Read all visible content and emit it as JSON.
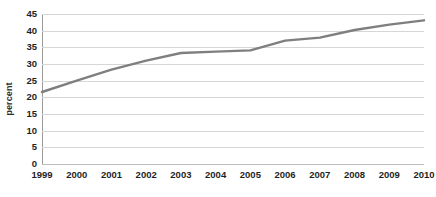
{
  "chart_data": {
    "type": "line",
    "title": "",
    "subtitle": "",
    "xlabel": "",
    "ylabel": "percent",
    "categories": [
      "1999",
      "2000",
      "2001",
      "2002",
      "2003",
      "2004",
      "2005",
      "2006",
      "2007",
      "2008",
      "2009",
      "2010"
    ],
    "values": [
      21.6,
      25.0,
      28.3,
      31.0,
      33.3,
      33.7,
      34.1,
      37.0,
      37.9,
      40.2,
      41.8,
      43.1
    ],
    "series": [
      {
        "name": "percent",
        "values": [
          21.6,
          25.0,
          28.3,
          31.0,
          33.3,
          33.7,
          34.1,
          37.0,
          37.9,
          40.2,
          41.8,
          43.1
        ]
      }
    ],
    "ylim": [
      0,
      45
    ],
    "y_ticks": [
      0,
      5,
      10,
      15,
      20,
      25,
      30,
      35,
      40,
      45
    ],
    "y_tick_labels": [
      "0",
      "5",
      "10",
      "15",
      "20",
      "25",
      "30",
      "35",
      "40",
      "45"
    ],
    "grid": true,
    "grid_axis": "y",
    "legend": false,
    "legend_position": "none",
    "markers": false,
    "annotations": [],
    "colors": {
      "line": "#7f7f7f",
      "gridline": "#d6d6d6",
      "axis": "#9a9a9a",
      "text": "#1f1f1f",
      "background": "#ffffff"
    },
    "line_width": 2.4
  }
}
